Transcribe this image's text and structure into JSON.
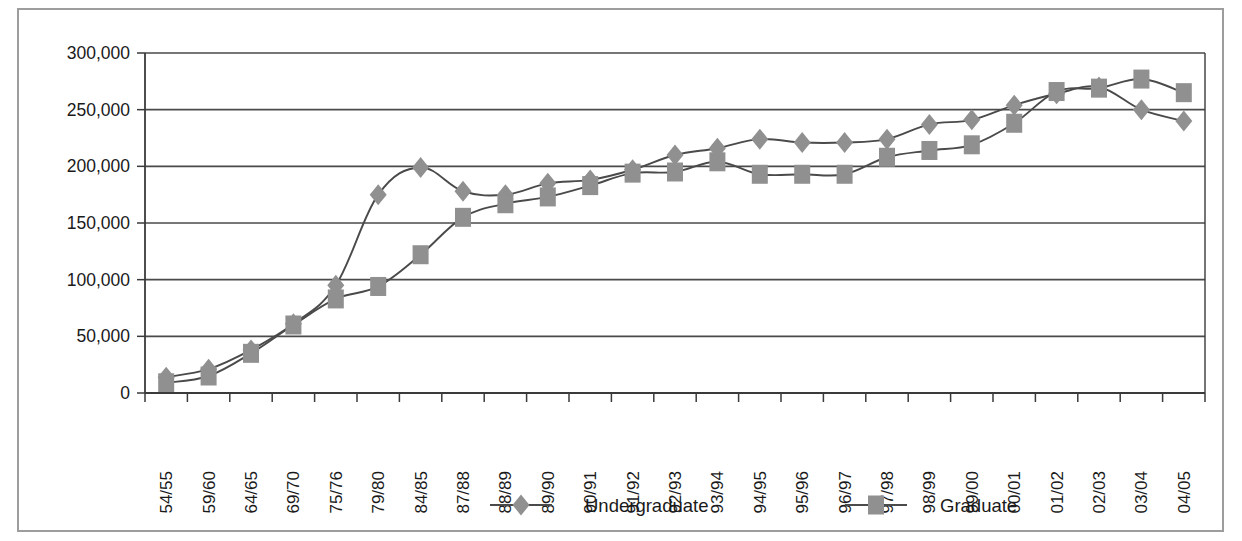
{
  "chart_data": {
    "type": "line",
    "title": "",
    "subtitle": "",
    "xlabel": "",
    "ylabel": "",
    "categories": [
      "54/55",
      "59/60",
      "64/65",
      "69/70",
      "75/76",
      "79/80",
      "84/85",
      "87/88",
      "88/89",
      "89/90",
      "90/91",
      "91/92",
      "92/93",
      "93/94",
      "94/95",
      "95/96",
      "96/97",
      "97/98",
      "98/99",
      "99/00",
      "00/01",
      "01/02",
      "02/03",
      "03/04",
      "04/05"
    ],
    "series": [
      {
        "name": "Undergraduate",
        "marker": "diamond",
        "values": [
          14000,
          21000,
          38000,
          61000,
          95000,
          175000,
          199000,
          178000,
          175000,
          185000,
          188000,
          197000,
          210000,
          216000,
          224000,
          221000,
          221000,
          224000,
          237000,
          241000,
          254000,
          264000,
          270000,
          250000,
          240000
        ]
      },
      {
        "name": "Graduate",
        "marker": "square",
        "values": [
          9000,
          15000,
          35000,
          60000,
          83000,
          94000,
          122000,
          155000,
          167000,
          173000,
          183000,
          194000,
          195000,
          204000,
          193000,
          193000,
          193000,
          208000,
          214000,
          219000,
          238000,
          266000,
          269000,
          277000,
          265000
        ]
      }
    ],
    "ylim": [
      0,
      300000
    ],
    "yticks": [
      0,
      50000,
      100000,
      150000,
      200000,
      250000,
      300000
    ],
    "ytick_labels": [
      "0",
      "50,000",
      "100,000",
      "150,000",
      "200,000",
      "250,000",
      "300,000"
    ],
    "grid": "horizontal",
    "legend_position": "bottom",
    "colors": {
      "marker_fill": "#909090",
      "line": "#4a4a4a",
      "grid": "#4a4a4a",
      "axis": "#3a3a3a",
      "text": "#1a1a1a",
      "frame_border": "#9d9d9d",
      "background": "#ffffff"
    }
  },
  "legend": {
    "items": [
      {
        "label": "Undergraduate",
        "marker": "diamond"
      },
      {
        "label": "Graduate",
        "marker": "square"
      }
    ]
  }
}
